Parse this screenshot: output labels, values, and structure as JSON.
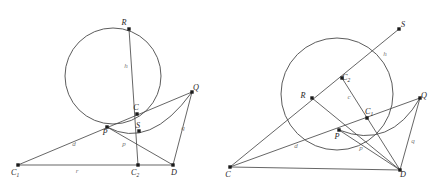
{
  "figure": {
    "background_color": "#ffffff",
    "line_color": "#4a4a4a",
    "point_color": "#1b1b1b",
    "label_color": "#262626",
    "segment_label_color": "#777777",
    "panel_count": 2
  },
  "left_diagram": {
    "name": "left-construction",
    "circle": {
      "cx": 113,
      "cy": 76,
      "r": 48
    },
    "points": [
      {
        "id": "R",
        "label": "R",
        "sub": "",
        "x": 129,
        "y": 29,
        "label_dx": -5,
        "label_dy": -4
      },
      {
        "id": "Q",
        "label": "Q",
        "sub": "",
        "x": 192,
        "y": 92,
        "label_dx": 4,
        "label_dy": -2
      },
      {
        "id": "C",
        "label": "C",
        "sub": "",
        "x": 137,
        "y": 114,
        "label_dx": -1,
        "label_dy": -4
      },
      {
        "id": "S",
        "label": "S",
        "sub": "",
        "x": 139,
        "y": 131,
        "label_dx": -1,
        "label_dy": -3
      },
      {
        "id": "P",
        "label": "P",
        "sub": "",
        "x": 107,
        "y": 127,
        "label_dx": -2,
        "label_dy": 8
      },
      {
        "id": "C1",
        "label": "C",
        "sub": "1",
        "x": 18,
        "y": 165,
        "label_dx": -3,
        "label_dy": 10
      },
      {
        "id": "C2",
        "label": "C",
        "sub": "2",
        "x": 138,
        "y": 165,
        "label_dx": -3,
        "label_dy": 10
      },
      {
        "id": "D",
        "label": "D",
        "sub": "",
        "x": 173,
        "y": 165,
        "label_dx": 1,
        "label_dy": 10
      }
    ],
    "segments": [
      {
        "from": "R",
        "to": "C2",
        "name": "segment-R-C2"
      },
      {
        "from": "C1",
        "to": "Q",
        "name": "segment-C1-Q"
      },
      {
        "from": "C1",
        "to": "D",
        "name": "segment-C1-D"
      },
      {
        "from": "Q",
        "to": "D",
        "name": "segment-Q-D"
      },
      {
        "from": "P",
        "to": "D",
        "name": "segment-P-D"
      }
    ],
    "arc": {
      "d": "M 107 127 Q 150 150 192 92",
      "name": "arc-P-Q"
    },
    "segment_labels": [
      {
        "text": "h",
        "x": 126,
        "y": 68,
        "name": "label-h"
      },
      {
        "text": "q",
        "x": 183,
        "y": 130,
        "name": "label-q"
      },
      {
        "text": "d",
        "x": 74,
        "y": 146,
        "name": "label-d"
      },
      {
        "text": "r",
        "x": 77,
        "y": 173,
        "name": "label-r"
      },
      {
        "text": "p",
        "x": 124,
        "y": 146,
        "name": "label-p"
      }
    ]
  },
  "right_diagram": {
    "name": "right-construction",
    "circle": {
      "cx": 337,
      "cy": 94,
      "r": 56
    },
    "points": [
      {
        "id": "S",
        "label": "S",
        "sub": "",
        "x": 399,
        "y": 29,
        "label_dx": 4,
        "label_dy": -2
      },
      {
        "id": "Q",
        "label": "Q",
        "sub": "",
        "x": 420,
        "y": 98,
        "label_dx": 4,
        "label_dy": 0
      },
      {
        "id": "R",
        "label": "R",
        "sub": "",
        "x": 312,
        "y": 98,
        "label_dx": -9,
        "label_dy": 0
      },
      {
        "id": "C2",
        "label": "C",
        "sub": "2",
        "x": 342,
        "y": 78,
        "label_dx": 4,
        "label_dy": 2
      },
      {
        "id": "C1",
        "label": "C",
        "sub": "1",
        "x": 367,
        "y": 118,
        "label_dx": 2,
        "label_dy": -4
      },
      {
        "id": "P",
        "label": "P",
        "sub": "",
        "x": 339,
        "y": 130,
        "label_dx": -2,
        "label_dy": 9
      },
      {
        "id": "C",
        "label": "C",
        "sub": "",
        "x": 230,
        "y": 167,
        "label_dx": -2,
        "label_dy": 10
      },
      {
        "id": "D",
        "label": "D",
        "sub": "",
        "x": 400,
        "y": 170,
        "label_dx": 3,
        "label_dy": 7
      }
    ],
    "segments": [
      {
        "from": "C",
        "to": "S",
        "name": "segment-C-S"
      },
      {
        "from": "C",
        "to": "Q",
        "name": "segment-C-Q"
      },
      {
        "from": "C",
        "to": "D",
        "name": "segment-C-D"
      },
      {
        "from": "P",
        "to": "D",
        "name": "segment-P-D"
      },
      {
        "from": "Q",
        "to": "D",
        "name": "segment-Q-D"
      },
      {
        "from": "R",
        "to": "D",
        "name": "segment-R-D"
      }
    ],
    "chord": {
      "from": "C2",
      "to": "D",
      "name": "chord-C2-D"
    },
    "arc": {
      "d": "M 339 130 Q 390 150 420 98",
      "name": "arc-P-Q"
    },
    "segment_labels": [
      {
        "text": "h",
        "x": 385,
        "y": 56,
        "name": "label-h"
      },
      {
        "text": "c",
        "x": 349,
        "y": 99,
        "name": "label-c"
      },
      {
        "text": "q",
        "x": 413,
        "y": 143,
        "name": "label-q"
      },
      {
        "text": "d",
        "x": 296,
        "y": 148,
        "name": "label-d"
      },
      {
        "text": "p",
        "x": 361,
        "y": 150,
        "name": "label-p"
      }
    ]
  }
}
